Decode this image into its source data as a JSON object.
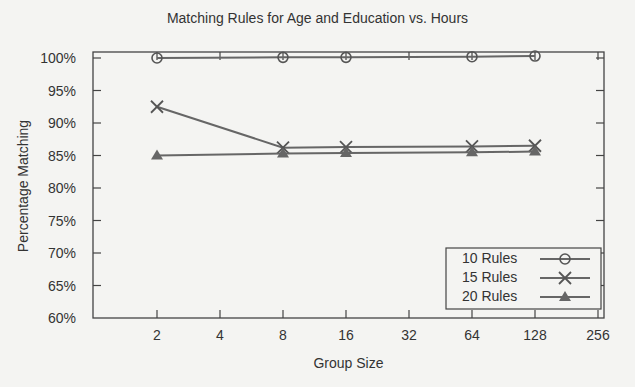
{
  "chart_data": {
    "type": "line",
    "title": "Matching Rules for Age and Education vs. Hours",
    "xlabel": "Group Size",
    "ylabel": "Percentage Matching",
    "x_scale": "log2",
    "x_ticks": [
      "2",
      "4",
      "8",
      "16",
      "32",
      "64",
      "128",
      "256"
    ],
    "y_ticks": [
      "100%",
      "95%",
      "90%",
      "85%",
      "80%",
      "75%",
      "70%",
      "65%",
      "60%"
    ],
    "ylim": [
      60,
      101
    ],
    "grid": false,
    "legend_position": "lower right",
    "x": [
      2,
      8,
      16,
      64,
      128
    ],
    "series": [
      {
        "name": "10 Rules",
        "marker": "circle",
        "values": [
          100.0,
          100.1,
          100.1,
          100.2,
          100.3
        ]
      },
      {
        "name": "15 Rules",
        "marker": "x",
        "values": [
          92.5,
          86.2,
          86.3,
          86.4,
          86.5
        ]
      },
      {
        "name": "20 Rules",
        "marker": "triangle",
        "values": [
          85.0,
          85.3,
          85.4,
          85.5,
          85.6
        ]
      }
    ]
  },
  "legend": {
    "items": [
      {
        "label": "10 Rules"
      },
      {
        "label": "15 Rules"
      },
      {
        "label": "20 Rules"
      }
    ]
  }
}
